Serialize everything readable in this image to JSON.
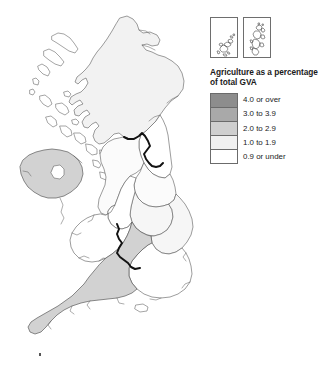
{
  "figure": {
    "kind": "choropleth-map",
    "region": "United Kingdom"
  },
  "insets": [
    {
      "name": "orkney-inset",
      "label": ""
    },
    {
      "name": "shetland-inset",
      "label": ""
    }
  ],
  "legend": {
    "title_line1": "Agriculture as a percentage",
    "title_line2": "of total GVA",
    "classes": [
      {
        "label": "4.0 or over",
        "color": "#8d8d8d"
      },
      {
        "label": "3.0 to 3.9",
        "color": "#a9a9a9"
      },
      {
        "label": "2.0 to 2.9",
        "color": "#cfcfcf"
      },
      {
        "label": "1.0 to 1.9",
        "color": "#f0f0f0"
      },
      {
        "label": "0.9 or under",
        "color": "#ffffff"
      }
    ]
  },
  "map_regions": [
    {
      "name": "scotland",
      "class": "1.0 to 1.9",
      "fill": "#f2f2f2"
    },
    {
      "name": "northern-ireland",
      "class": "2.0 to 2.9",
      "fill": "#d2d2d2"
    },
    {
      "name": "wales",
      "class": "0.9 or under",
      "fill": "#ffffff"
    },
    {
      "name": "north-east-england",
      "class": "0.9 or under",
      "fill": "#ffffff"
    },
    {
      "name": "north-west-england",
      "class": "0.9 or under",
      "fill": "#fbfbfb"
    },
    {
      "name": "yorkshire-humber",
      "class": "0.9 or under",
      "fill": "#fbfbfb"
    },
    {
      "name": "east-midlands",
      "class": "1.0 to 1.9",
      "fill": "#f6f6f6"
    },
    {
      "name": "west-midlands",
      "class": "0.9 or under",
      "fill": "#ffffff"
    },
    {
      "name": "east-of-england",
      "class": "1.0 to 1.9",
      "fill": "#f6f6f6"
    },
    {
      "name": "london",
      "class": "0.9 or under",
      "fill": "#ffffff"
    },
    {
      "name": "south-east-england",
      "class": "0.9 or under",
      "fill": "#ffffff"
    },
    {
      "name": "south-west-england",
      "class": "2.0 to 2.9",
      "fill": "#d2d2d2"
    }
  ],
  "map_features": {
    "national_border_label": "Scotland-England and Wales-England borders",
    "lough_neagh_label": "Lough Neagh",
    "isles_of_scilly_label": "Isles of Scilly"
  }
}
